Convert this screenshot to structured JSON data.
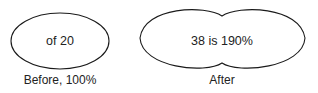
{
  "before": {
    "inner_text": "of 20",
    "caption": "Before, 100%"
  },
  "after": {
    "inner_text": "38 is 190%",
    "caption": "After"
  },
  "colors": {
    "stroke": "#1a1a1a",
    "background": "#ffffff"
  }
}
